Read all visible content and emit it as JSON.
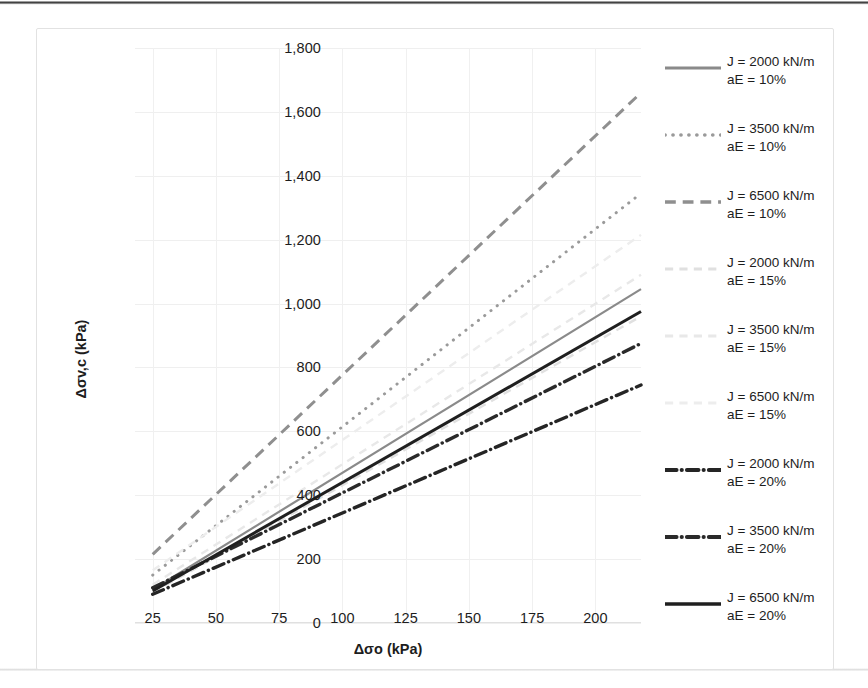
{
  "chart_data": {
    "type": "line",
    "title": "",
    "xlabel": "Δσo (kPa)",
    "ylabel": "Δσv,c (kPa)",
    "xlim": [
      18,
      218
    ],
    "ylim": [
      0,
      1800
    ],
    "x_ticks": [
      25,
      50,
      75,
      100,
      125,
      150,
      175,
      200
    ],
    "y_ticks": [
      0,
      200,
      400,
      600,
      800,
      1000,
      1200,
      1400,
      1600,
      1800
    ],
    "y_tick_labels": [
      "0",
      "200",
      "400",
      "600",
      "800",
      "1,000",
      "1,200",
      "1,400",
      "1,600",
      "1,800"
    ],
    "x_tick_labels": [
      "25",
      "50",
      "75",
      "100",
      "125",
      "150",
      "175",
      "200"
    ],
    "grid": true,
    "legend_position": "right",
    "x": [
      25,
      218
    ],
    "series": [
      {
        "name": "J = 2000 kN/m aE = 10%",
        "J": 2000,
        "aE": "10%",
        "style": "solid",
        "color": "#8a8a8a",
        "width": 2.2,
        "values": [
          105,
          1045
        ]
      },
      {
        "name": "J = 3500 kN/m aE = 10%",
        "J": 3500,
        "aE": "10%",
        "style": "dotted",
        "color": "#9a9a9a",
        "width": 3.0,
        "values": [
          150,
          1345
        ]
      },
      {
        "name": "J = 6500 kN/m aE = 10%",
        "J": 6500,
        "aE": "10%",
        "style": "dashed",
        "color": "#8f8f8f",
        "width": 3.0,
        "values": [
          215,
          1660
        ]
      },
      {
        "name": "J = 2000 kN/m aE = 15%",
        "J": 2000,
        "aE": "15%",
        "style": "dashed-light",
        "color": "#e0e0e0",
        "width": 2.4,
        "values": [
          95,
          960
        ]
      },
      {
        "name": "J = 3500 kN/m aE = 15%",
        "J": 3500,
        "aE": "15%",
        "style": "dashed-light",
        "color": "#e8e8e8",
        "width": 2.4,
        "values": [
          120,
          1090
        ]
      },
      {
        "name": "J = 6500 kN/m aE = 15%",
        "J": 6500,
        "aE": "15%",
        "style": "dashed-light",
        "color": "#ededed",
        "width": 2.4,
        "values": [
          165,
          1215
        ]
      },
      {
        "name": "J = 2000 kN/m aE = 20%",
        "J": 2000,
        "aE": "20%",
        "style": "dashdot",
        "color": "#252525",
        "width": 3.4,
        "values": [
          90,
          745
        ]
      },
      {
        "name": "J = 3500 kN/m aE = 20%",
        "J": 3500,
        "aE": "20%",
        "style": "dashdot",
        "color": "#2a2a2a",
        "width": 3.4,
        "values": [
          110,
          875
        ]
      },
      {
        "name": "J = 6500 kN/m aE = 20%",
        "J": 6500,
        "aE": "20%",
        "style": "solid-dark",
        "color": "#1f1f1f",
        "width": 3.0,
        "values": [
          100,
          975
        ]
      }
    ]
  },
  "legend": {
    "items": [
      {
        "line1": "J = 2000 kN/m",
        "line2": "aE = 10%"
      },
      {
        "line1": "J = 3500 kN/m",
        "line2": "aE = 10%"
      },
      {
        "line1": "J = 6500 kN/m",
        "line2": "aE = 10%"
      },
      {
        "line1": "J = 2000 kN/m",
        "line2": "aE = 15%"
      },
      {
        "line1": "J = 3500 kN/m",
        "line2": "aE = 15%"
      },
      {
        "line1": "J = 6500 kN/m",
        "line2": "aE = 15%"
      },
      {
        "line1": "J = 2000 kN/m",
        "line2": "aE = 20%"
      },
      {
        "line1": "J = 3500 kN/m",
        "line2": "aE = 20%"
      },
      {
        "line1": "J = 6500 kN/m",
        "line2": "aE = 20%"
      }
    ]
  },
  "colors": {
    "grid": "#efefef",
    "axis": "#e0e0e0",
    "text": "#1d1d1d",
    "frame": "#e2e2e2"
  }
}
